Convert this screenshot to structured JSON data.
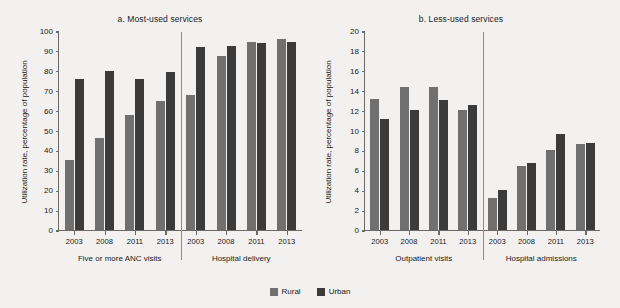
{
  "figure": {
    "ylabel": "Utilization rate, percentage of population"
  },
  "legend": {
    "position": "bottom-center",
    "items": [
      {
        "label": "Rural",
        "color": "#707070"
      },
      {
        "label": "Urban",
        "color": "#3b3b3b"
      }
    ]
  },
  "chart_data": [
    {
      "type": "bar",
      "title": "a. Most-used services",
      "xlabel": "",
      "ylabel": "Utilization rate, percentage of population",
      "ylim": [
        0,
        100
      ],
      "yticks": [
        0,
        10,
        20,
        30,
        40,
        50,
        60,
        70,
        80,
        90,
        100
      ],
      "grid": false,
      "groups": [
        {
          "label": "Five or more ANC visits",
          "categories": [
            "2003",
            "2008",
            "2011",
            "2013"
          ]
        },
        {
          "label": "Hospital delivery",
          "categories": [
            "2003",
            "2008",
            "2011",
            "2013"
          ]
        }
      ],
      "categories": [
        "2003",
        "2008",
        "2011",
        "2013",
        "2003",
        "2008",
        "2011",
        "2013"
      ],
      "series": [
        {
          "name": "Rural",
          "color": "#707070",
          "values": [
            35,
            46,
            58,
            65,
            68,
            87.5,
            94.5,
            96
          ]
        },
        {
          "name": "Urban",
          "color": "#3b3b3b",
          "values": [
            76,
            80,
            76,
            79.5,
            92,
            92.5,
            94,
            94.5
          ]
        }
      ]
    },
    {
      "type": "bar",
      "title": "b. Less-used services",
      "xlabel": "",
      "ylabel": "Utilization rate, percentage of population",
      "ylim": [
        0,
        20
      ],
      "yticks": [
        0,
        2,
        4,
        6,
        8,
        10,
        12,
        14,
        16,
        18,
        20
      ],
      "grid": false,
      "groups": [
        {
          "label": "Outpatient visits",
          "categories": [
            "2003",
            "2008",
            "2011",
            "2013"
          ]
        },
        {
          "label": "Hospital admissions",
          "categories": [
            "2003",
            "2008",
            "2011",
            "2013"
          ]
        }
      ],
      "categories": [
        "2003",
        "2008",
        "2011",
        "2013",
        "2003",
        "2008",
        "2011",
        "2013"
      ],
      "series": [
        {
          "name": "Rural",
          "color": "#707070",
          "values": [
            13.2,
            14.4,
            14.4,
            12.1,
            3.2,
            6.4,
            8.0,
            8.6
          ]
        },
        {
          "name": "Urban",
          "color": "#3b3b3b",
          "values": [
            11.2,
            12.1,
            13.1,
            12.6,
            4.0,
            6.7,
            9.7,
            8.7
          ]
        }
      ]
    }
  ]
}
